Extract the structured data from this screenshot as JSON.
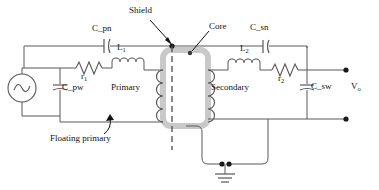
{
  "diagram": {
    "type": "transformer-equivalent-circuit",
    "colors": {
      "wire": "#58585a",
      "text": "#111111",
      "core": "#c9c9c9",
      "node": "#1a1a1a",
      "background": "#ffffff"
    },
    "labels": {
      "shield": "Shield",
      "core": "Core",
      "c_pn": "C_pn",
      "c_sn": "C_sn",
      "c_pw": "C_pw",
      "c_sw": "C_sw",
      "l1": "L",
      "l1_sub": "1",
      "l2": "L",
      "l2_sub": "2",
      "r1": "r",
      "r1_sub": "1",
      "r2": "r",
      "r2_sub": "2",
      "primary": "Primary",
      "secondary": "Secondary",
      "v_out": "V",
      "v_out_sub": "o",
      "floating_primary": "Floating primary"
    },
    "components": [
      {
        "name": "ac-source",
        "kind": "ac-voltage-source",
        "label": ""
      },
      {
        "name": "capacitor-c-pn",
        "kind": "capacitor",
        "label": "C_pn"
      },
      {
        "name": "capacitor-c-pw",
        "kind": "capacitor",
        "label": "C_pw"
      },
      {
        "name": "inductor-l1",
        "kind": "inductor",
        "label": "L1"
      },
      {
        "name": "resistor-r1",
        "kind": "resistor",
        "label": "r1"
      },
      {
        "name": "primary-winding",
        "kind": "winding",
        "label": "Primary"
      },
      {
        "name": "transformer-core",
        "kind": "core",
        "label": "Core"
      },
      {
        "name": "electrostatic-shield",
        "kind": "shield",
        "label": "Shield"
      },
      {
        "name": "secondary-winding",
        "kind": "winding",
        "label": "Secondary"
      },
      {
        "name": "inductor-l2",
        "kind": "inductor",
        "label": "L2"
      },
      {
        "name": "resistor-r2",
        "kind": "resistor",
        "label": "r2"
      },
      {
        "name": "capacitor-c-sn",
        "kind": "capacitor",
        "label": "C_sn"
      },
      {
        "name": "capacitor-c-sw",
        "kind": "capacitor",
        "label": "C_sw"
      },
      {
        "name": "ground",
        "kind": "earth-ground",
        "label": ""
      },
      {
        "name": "output-terminals",
        "kind": "terminal-pair",
        "label": "Vo"
      }
    ]
  }
}
